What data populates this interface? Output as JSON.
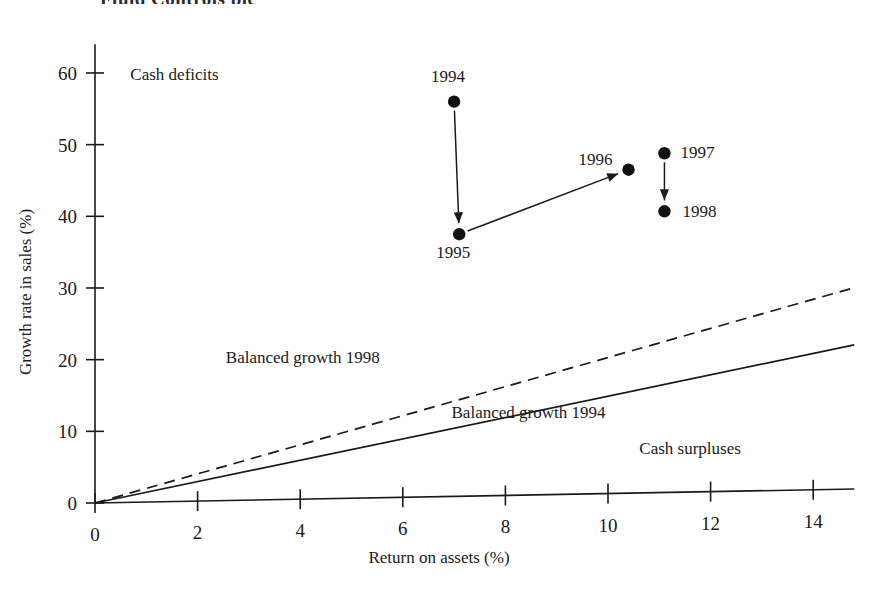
{
  "figure": {
    "clipped_header_text": "Fluid  Controls  plc",
    "background_color": "#ffffff",
    "ink_color": "#1a1a1a"
  },
  "chart_data": {
    "type": "scatter",
    "title": "",
    "xlabel": "Return on assets (%)",
    "ylabel": "Growth rate in sales (%)",
    "xlim": [
      0,
      14.8
    ],
    "ylim": [
      0,
      64
    ],
    "xticks": [
      "0",
      "2",
      "4",
      "6",
      "8",
      "10",
      "12",
      "14"
    ],
    "xtick_values": [
      0,
      2,
      4,
      6,
      8,
      10,
      12,
      14
    ],
    "yticks": [
      "0",
      "10",
      "20",
      "30",
      "40",
      "50",
      "60"
    ],
    "ytick_values": [
      0,
      10,
      20,
      30,
      40,
      50,
      60
    ],
    "grid": false,
    "legend_position": "none",
    "points": [
      {
        "label": "1994",
        "x": 7.0,
        "y": 56.0,
        "label_dx": -6,
        "label_dy": -20,
        "anchor": "middle"
      },
      {
        "label": "1995",
        "x": 7.1,
        "y": 37.5,
        "label_dx": -6,
        "label_dy": 24,
        "anchor": "middle"
      },
      {
        "label": "1996",
        "x": 10.4,
        "y": 46.5,
        "label_dx": -16,
        "label_dy": -5,
        "anchor": "end"
      },
      {
        "label": "1997",
        "x": 11.1,
        "y": 48.8,
        "label_dx": 16,
        "label_dy": 5,
        "anchor": "start"
      },
      {
        "label": "1998",
        "x": 11.1,
        "y": 40.7,
        "label_dx": 18,
        "label_dy": 6,
        "anchor": "start"
      }
    ],
    "arrows": [
      {
        "name": "arrow-1994-to-1995",
        "from": "1994",
        "to": "1995"
      },
      {
        "name": "arrow-1995-to-1996",
        "from": "1995",
        "to": "1996"
      },
      {
        "name": "arrow-1997-to-1998",
        "from": "1997",
        "to": "1998"
      }
    ],
    "series": [
      {
        "name": "Balanced growth 1994",
        "style": "solid",
        "slope": 1.49,
        "x_start": 0,
        "x_end": 14.8,
        "label": "Balanced growth 1994",
        "label_x": 8.45,
        "label_y": 11.9
      },
      {
        "name": "Balanced growth 1998",
        "style": "dashed",
        "slope": 2.03,
        "x_start": 0,
        "x_end": 14.8,
        "label": "Balanced growth 1998",
        "label_x": 4.05,
        "label_y": 19.6
      }
    ],
    "annotations": [
      {
        "name": "cash-deficits-label",
        "text": "Cash deficits",
        "x": 1.55,
        "y": 59.0
      },
      {
        "name": "cash-surpluses-label",
        "text": "Cash surpluses",
        "x": 11.6,
        "y": 6.9
      }
    ]
  }
}
